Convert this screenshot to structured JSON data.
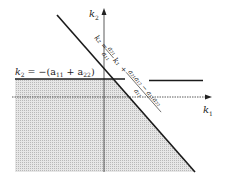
{
  "diagram": {
    "title": "",
    "axes": {
      "horizontal": {
        "label": "k",
        "label_sub": "1"
      },
      "vertical": {
        "label": "k",
        "label_sub": "2"
      }
    },
    "lines": {
      "horizontal_boundary": {
        "equation_prefix": "k",
        "equation_prefix_sub": "2",
        "equation_rest": " = −(a",
        "a11_sub": "11",
        "plus": " + a",
        "a22_sub": "22",
        "close": ")"
      },
      "diagonal_boundary": {
        "left_part": "k₂ = ",
        "frac1_num": "a₂₁",
        "frac1_den": "a₁₁",
        "k1_term": "k₁",
        "plus": "+",
        "frac2_num": "a₂₁a₁₂ − a₁₁a₂₂",
        "frac2_den": "a₁₁"
      }
    },
    "region": {
      "description": "stability region (shaded)",
      "fill_color": "#cfcfcf"
    },
    "colors": {
      "ink": "#1a1a1a",
      "shade": "#d4d4d4",
      "background": "#ffffff"
    }
  }
}
